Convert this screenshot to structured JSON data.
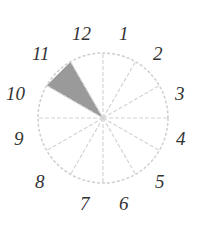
{
  "diagram": {
    "type": "clock-dial-sectors",
    "center": [
      103,
      118
    ],
    "radius": 65,
    "sector_count": 12,
    "line_color": "#cfcfcf",
    "shade_color": "#9a9a9a",
    "shaded_sector": {
      "from_deg": -60,
      "to_deg": -30,
      "between_labels": [
        "10",
        "11"
      ]
    },
    "labels": [
      {
        "text": "12",
        "x": 82,
        "y": 40
      },
      {
        "text": "1",
        "x": 122,
        "y": 40
      },
      {
        "text": "2",
        "x": 155,
        "y": 58
      },
      {
        "text": "3",
        "x": 177,
        "y": 100
      },
      {
        "text": "4",
        "x": 178,
        "y": 143
      },
      {
        "text": "5",
        "x": 157,
        "y": 186
      },
      {
        "text": "6",
        "x": 123,
        "y": 208
      },
      {
        "text": "7",
        "x": 82,
        "y": 208
      },
      {
        "text": "8",
        "x": 37,
        "y": 186
      },
      {
        "text": "9",
        "x": 14,
        "y": 143
      },
      {
        "text": "10",
        "x": 7,
        "y": 100
      },
      {
        "text": "11",
        "x": 33,
        "y": 58
      }
    ]
  }
}
